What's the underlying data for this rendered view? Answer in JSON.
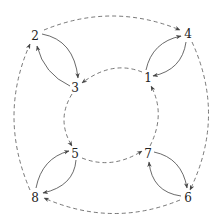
{
  "diagram": {
    "type": "directed-graph",
    "width": 222,
    "height": 224,
    "colors": {
      "background": "#ffffff",
      "solid_edge": "#444444",
      "dashed_edge": "#555555",
      "label": "#222222"
    },
    "nodes": [
      {
        "id": "1",
        "label": "1",
        "x": 148,
        "y": 78
      },
      {
        "id": "2",
        "label": "2",
        "x": 35,
        "y": 36
      },
      {
        "id": "3",
        "label": "3",
        "x": 75,
        "y": 88
      },
      {
        "id": "4",
        "label": "4",
        "x": 188,
        "y": 34
      },
      {
        "id": "5",
        "label": "5",
        "x": 75,
        "y": 154
      },
      {
        "id": "6",
        "label": "6",
        "x": 188,
        "y": 198
      },
      {
        "id": "7",
        "label": "7",
        "x": 148,
        "y": 154
      },
      {
        "id": "8",
        "label": "8",
        "x": 35,
        "y": 198
      }
    ],
    "solid_edges": [
      {
        "from": "2",
        "to": "3"
      },
      {
        "from": "3",
        "to": "2"
      },
      {
        "from": "1",
        "to": "4"
      },
      {
        "from": "4",
        "to": "1"
      },
      {
        "from": "5",
        "to": "8"
      },
      {
        "from": "8",
        "to": "5"
      },
      {
        "from": "7",
        "to": "6"
      },
      {
        "from": "6",
        "to": "7"
      }
    ],
    "dashed_outer_edges": [
      {
        "from": "2",
        "to": "4"
      },
      {
        "from": "4",
        "to": "6"
      },
      {
        "from": "6",
        "to": "8"
      },
      {
        "from": "8",
        "to": "2"
      }
    ],
    "dashed_inner_edges": [
      {
        "from": "1",
        "to": "3"
      },
      {
        "from": "3",
        "to": "5"
      },
      {
        "from": "5",
        "to": "7"
      },
      {
        "from": "7",
        "to": "1"
      }
    ]
  }
}
